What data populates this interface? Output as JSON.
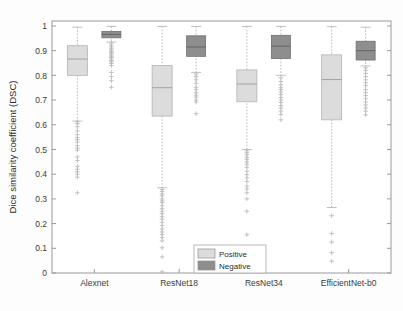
{
  "chart_data": {
    "type": "box",
    "title": "",
    "xlabel": "",
    "ylabel": "Dice similarity coefficient (DSC)",
    "ylim": [
      0,
      1.02
    ],
    "ytick_labels": [
      "0",
      "0.1",
      "0.2",
      "0.3",
      "0.4",
      "0.5",
      "0.6",
      "0.7",
      "0.8",
      "0.9",
      "1"
    ],
    "ytick_values": [
      0,
      0.1,
      0.2,
      0.3,
      0.4,
      0.5,
      0.6,
      0.7,
      0.8,
      0.9,
      1
    ],
    "categories": [
      "Alexnet",
      "ResNet18",
      "ResNet34",
      "EfficientNet-b0"
    ],
    "grid": false,
    "legend_position": "bottom-center",
    "legend": [
      {
        "name": "Positive",
        "color": "#dcdcdc"
      },
      {
        "name": "Negative",
        "color": "#8e8e8e"
      }
    ],
    "series": [
      {
        "name": "Positive",
        "color": "#dcdcdc",
        "boxes": [
          {
            "category": "Alexnet",
            "whisker_low": 0.615,
            "q1": 0.8,
            "median": 0.866,
            "q3": 0.92,
            "whisker_high": 0.995,
            "outliers": [
              0.612,
              0.605,
              0.592,
              0.575,
              0.56,
              0.548,
              0.54,
              0.53,
              0.515,
              0.505,
              0.497,
              0.47,
              0.455,
              0.432,
              0.42,
              0.41,
              0.4,
              0.388,
              0.325
            ]
          },
          {
            "category": "ResNet18",
            "whisker_low": 0.345,
            "q1": 0.635,
            "median": 0.75,
            "q3": 0.84,
            "whisker_high": 0.998,
            "outliers": [
              0.338,
              0.33,
              0.32,
              0.312,
              0.3,
              0.292,
              0.285,
              0.272,
              0.26,
              0.25,
              0.24,
              0.228,
              0.218,
              0.205,
              0.192,
              0.178,
              0.166,
              0.155,
              0.143,
              0.13,
              0.102,
              0.065,
              0.005
            ]
          },
          {
            "category": "ResNet34",
            "whisker_low": 0.5,
            "q1": 0.693,
            "median": 0.765,
            "q3": 0.822,
            "whisker_high": 0.998,
            "outliers": [
              0.495,
              0.487,
              0.478,
              0.468,
              0.46,
              0.45,
              0.44,
              0.428,
              0.412,
              0.398,
              0.385,
              0.37,
              0.352,
              0.34,
              0.325,
              0.3,
              0.25,
              0.155,
              0.05
            ]
          },
          {
            "category": "EfficientNet-b0",
            "whisker_low": 0.265,
            "q1": 0.62,
            "median": 0.783,
            "q3": 0.883,
            "whisker_high": 0.997,
            "outliers": [
              0.232,
              0.16,
              0.125,
              0.082,
              0.048
            ]
          }
        ]
      },
      {
        "name": "Negative",
        "color": "#8e8e8e",
        "boxes": [
          {
            "category": "Alexnet",
            "whisker_low": 0.935,
            "q1": 0.952,
            "median": 0.966,
            "q3": 0.978,
            "whisker_high": 0.998,
            "outliers": [
              0.93,
              0.922,
              0.915,
              0.908,
              0.902,
              0.898,
              0.893,
              0.888,
              0.882,
              0.877,
              0.872,
              0.866,
              0.86,
              0.855,
              0.848,
              0.84,
              0.812,
              0.795,
              0.778,
              0.752
            ]
          },
          {
            "category": "ResNet18",
            "whisker_low": 0.812,
            "q1": 0.877,
            "median": 0.915,
            "q3": 0.96,
            "whisker_high": 0.998,
            "outliers": [
              0.805,
              0.795,
              0.782,
              0.768,
              0.752,
              0.742,
              0.73,
              0.72,
              0.712,
              0.7,
              0.692,
              0.645
            ]
          },
          {
            "category": "ResNet34",
            "whisker_low": 0.8,
            "q1": 0.868,
            "median": 0.918,
            "q3": 0.962,
            "whisker_high": 0.998,
            "outliers": [
              0.79,
              0.775,
              0.762,
              0.75,
              0.742,
              0.732,
              0.722,
              0.71,
              0.7,
              0.69,
              0.678,
              0.668,
              0.655,
              0.642,
              0.62
            ]
          },
          {
            "category": "EfficientNet-b0",
            "whisker_low": 0.838,
            "q1": 0.862,
            "median": 0.9,
            "q3": 0.938,
            "whisker_high": 0.995,
            "outliers": [
              0.83,
              0.82,
              0.808,
              0.795,
              0.782,
              0.77,
              0.758,
              0.742,
              0.73,
              0.718,
              0.705,
              0.692,
              0.68,
              0.668,
              0.655,
              0.64
            ]
          }
        ]
      }
    ]
  }
}
